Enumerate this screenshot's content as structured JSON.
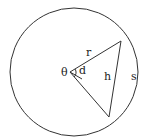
{
  "diagram": {
    "type": "circle-chord-geometry",
    "labels": {
      "theta": "θ",
      "radius": "r",
      "apothem": "d",
      "chord": "h",
      "arc": "s"
    },
    "colors": {
      "stroke": "#333333",
      "background": "#ffffff"
    }
  }
}
